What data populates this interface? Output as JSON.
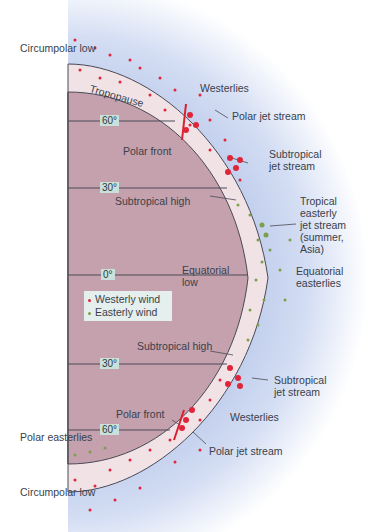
{
  "colors": {
    "atmosphere_outer": "#c7d3ef",
    "atmosphere_inner": "#f1e4e8",
    "earth": "#c4a1ad",
    "westerly": "#e0253a",
    "easterly": "#7aa048",
    "line": "#4a4a55"
  },
  "latitudes": {
    "n60": "60°",
    "n30": "30°",
    "eq": "0°",
    "s30": "30°",
    "s60": "60°"
  },
  "labels": {
    "circumpolar_low_n": "Circumpolar low",
    "tropopause": "Tropopause",
    "westerlies_n": "Westerlies",
    "polar_jet_n": "Polar jet stream",
    "polar_front_n": "Polar front",
    "subtropical_jet_n_1": "Subtropical",
    "subtropical_jet_n_2": "jet stream",
    "subtropical_high_n": "Subtropical high",
    "tropical_jet_1": "Tropical",
    "tropical_jet_2": "easterly",
    "tropical_jet_3": "jet stream",
    "tropical_jet_4": "(summer,",
    "tropical_jet_5": "Asia)",
    "equatorial_low_1": "Equatorial",
    "equatorial_low_2": "low",
    "equatorial_easterlies_1": "Equatorial",
    "equatorial_easterlies_2": "easterlies",
    "subtropical_high_s": "Subtropical high",
    "subtropical_jet_s_1": "Subtropical",
    "subtropical_jet_s_2": "jet stream",
    "polar_front_s": "Polar front",
    "westerlies_s": "Westerlies",
    "polar_easterlies": "Polar easterlies",
    "polar_jet_s": "Polar jet stream",
    "circumpolar_low_s": "Circumpolar low"
  },
  "legend": {
    "westerly": "Westerly wind",
    "easterly": "Easterly wind"
  },
  "markers": {
    "high": "H",
    "low": "L"
  }
}
